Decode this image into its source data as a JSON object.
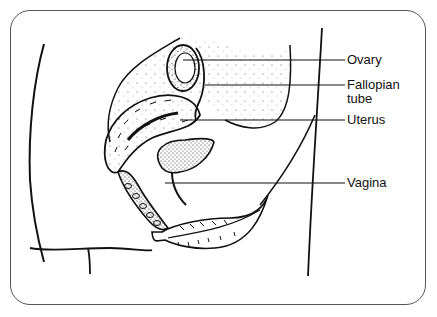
{
  "diagram": {
    "type": "anatomical-illustration",
    "labels": [
      {
        "id": "ovary",
        "text": "Ovary",
        "x": 345,
        "y": 53,
        "line_y": 60,
        "line_x1": 200
      },
      {
        "id": "fallopian-tube",
        "text": "Fallopian\ntube",
        "x": 345,
        "y": 76,
        "line_y": 85,
        "line_x1": 205
      },
      {
        "id": "uterus",
        "text": "Uterus",
        "x": 345,
        "y": 113,
        "line_y": 120,
        "line_x1": 180
      },
      {
        "id": "vagina",
        "text": "Vagina",
        "x": 345,
        "y": 176,
        "line_y": 183,
        "line_x1": 165
      }
    ]
  },
  "colors": {
    "ink": "#111111",
    "frame": "#555555",
    "background": "#ffffff"
  }
}
